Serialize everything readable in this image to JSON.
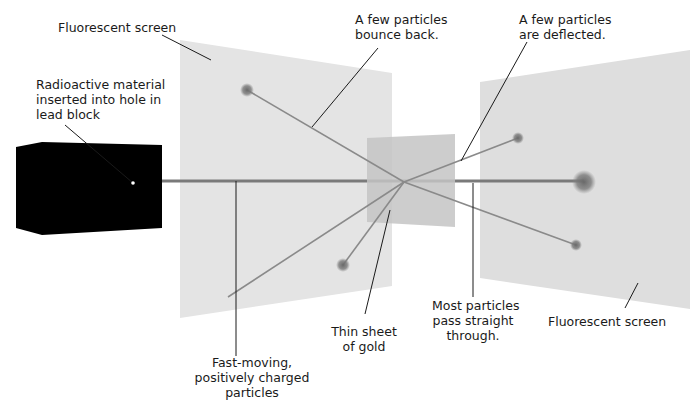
{
  "diagram": {
    "labels": {
      "fluorescent_screen_left": "Fluorescent screen",
      "radioactive_material": [
        "Radioactive material",
        "inserted into hole in",
        "lead block"
      ],
      "bounce_back": [
        "A few particles",
        "bounce back."
      ],
      "deflected": [
        "A few particles",
        "are deflected."
      ],
      "particles": [
        "Fast-moving,",
        "positively charged",
        "particles"
      ],
      "gold_sheet": [
        "Thin sheet",
        "of gold"
      ],
      "pass_through": [
        "Most particles",
        "pass straight",
        "through."
      ],
      "fluorescent_screen_right": "Fluorescent screen"
    },
    "colors": {
      "lead_block": "#000000",
      "screen": "#e3e3e3",
      "gold_sheet": "#c8c8c8",
      "beam": "#7a7a7a",
      "path": "#8a8a8a",
      "leader": "#1a1a1a",
      "spot": "#707070"
    }
  }
}
